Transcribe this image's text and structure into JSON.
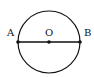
{
  "diagram": {
    "type": "circle-with-diameter",
    "circle": {
      "center": "O",
      "cx": 49,
      "cy": 42,
      "r": 31
    },
    "diameter": {
      "from": "A",
      "to": "B"
    },
    "points": [
      {
        "id": "A",
        "label": "A",
        "x": 18,
        "y": 42,
        "label_x": 7,
        "label_y": 36
      },
      {
        "id": "O",
        "label": "O",
        "x": 49,
        "y": 42,
        "label_x": 45,
        "label_y": 36
      },
      {
        "id": "B",
        "label": "B",
        "x": 80,
        "y": 42,
        "label_x": 84,
        "label_y": 36
      }
    ],
    "stroke_color": "#111111"
  }
}
